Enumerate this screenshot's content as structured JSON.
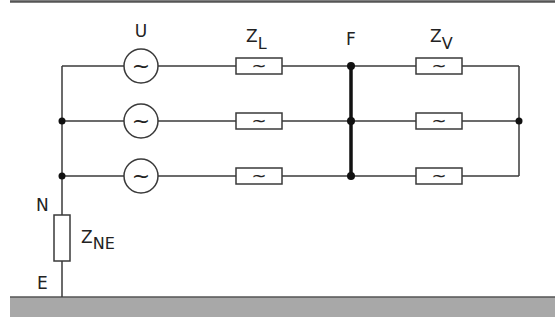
{
  "diagram": {
    "title": "",
    "colors": {
      "line": "#3a3a3a",
      "ground_fill": "#a8a8a8",
      "top_border": "#555555",
      "background": "#ffffff"
    },
    "labels": {
      "source": "U",
      "line_impedance_main": "Z",
      "line_impedance_sub": "L",
      "fault_point": "F",
      "load_impedance_main": "Z",
      "load_impedance_sub": "V",
      "neutral": "N",
      "earth": "E",
      "neutral_earth_impedance_main": "Z",
      "neutral_earth_impedance_sub": "NE"
    },
    "symbols": {
      "ac_glyph": "~"
    },
    "phases": [
      {
        "row": 1,
        "source": "~",
        "line_impedance": "~",
        "load_impedance": "~"
      },
      {
        "row": 2,
        "source": "~",
        "line_impedance": "~",
        "load_impedance": "~"
      },
      {
        "row": 3,
        "source": "~",
        "line_impedance": "~",
        "load_impedance": "~"
      }
    ]
  }
}
